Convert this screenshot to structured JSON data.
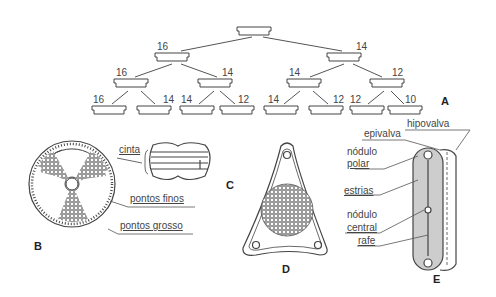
{
  "figure_a": {
    "letter": "A",
    "level1": [
      "16",
      "14"
    ],
    "level2": [
      "16",
      "14",
      "14",
      "12"
    ],
    "level3": [
      "16",
      "14",
      "14",
      "12",
      "14",
      "12",
      "12",
      "10"
    ]
  },
  "figure_b": {
    "letter": "B",
    "labels": [
      "pontos finos",
      "pontos grosso"
    ]
  },
  "figure_c": {
    "letter": "C",
    "labels": [
      "cinta"
    ]
  },
  "figure_d": {
    "letter": "D"
  },
  "figure_e": {
    "letter": "E",
    "labels": {
      "hipovalva": "hipovalva",
      "epivalva": "epivalva",
      "nodulo_polar_1": "nódulo",
      "nodulo_polar_2": "polar",
      "estrias": "estrias",
      "nodulo_central_1": "nódulo",
      "nodulo_central_2": "central",
      "rafe": "rafe"
    }
  }
}
